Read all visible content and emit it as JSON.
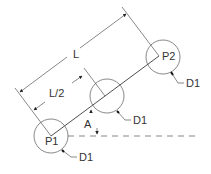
{
  "diagram": {
    "points": [
      {
        "id": "p1",
        "label": "P1",
        "diameter_label": "D1"
      },
      {
        "id": "mid",
        "label": "",
        "diameter_label": "D1"
      },
      {
        "id": "p2",
        "label": "P2",
        "diameter_label": "D1"
      }
    ],
    "dimensions": {
      "length_label": "L",
      "half_length_label": "L/2",
      "angle_label": "A"
    },
    "colors": {
      "line": "#3a3a3a",
      "text": "#333333",
      "background": "#ffffff"
    }
  }
}
